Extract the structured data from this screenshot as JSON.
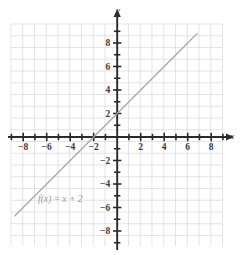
{
  "figure": {
    "title": "",
    "background_color": "#ffffff",
    "grid_color": "#d9d7e0",
    "axis_color": "#2b2b2b",
    "line_color": "#a8a8a8",
    "label_color": "#3b3b3b",
    "fn_label_color": "#9a9a9a"
  },
  "axes": {
    "x_axis_name": "x",
    "y_axis_name": "y",
    "x_tick_labels": [
      "-8",
      "-6",
      "-4",
      "-2",
      "2",
      "4",
      "6",
      "8"
    ],
    "y_tick_labels": [
      "8",
      "6",
      "4",
      "2",
      "-2",
      "-4",
      "-6",
      "-8"
    ],
    "x_tick_values": [
      -8,
      -6,
      -4,
      -2,
      2,
      4,
      6,
      8
    ],
    "y_tick_values": [
      8,
      6,
      4,
      2,
      -2,
      -4,
      -6,
      -8
    ],
    "minor_tick_values": [
      -9,
      -8,
      -7,
      -6,
      -5,
      -4,
      -3,
      -2,
      -1,
      1,
      2,
      3,
      4,
      5,
      6,
      7,
      8,
      9
    ]
  },
  "annotations": {
    "function_label": "f(x) = x + 2",
    "function_label_x": -6.6,
    "function_label_y": -5.2
  },
  "chart_data": {
    "type": "line",
    "title": "",
    "xlabel": "x",
    "ylabel": "y",
    "xlim": [
      -9,
      9
    ],
    "ylim": [
      -9.5,
      9.5
    ],
    "grid": true,
    "legend": "none",
    "series": [
      {
        "name": "f(x) = x + 2",
        "equation": "f(x) = x + 2",
        "slope": 1,
        "y_intercept": 2,
        "x_intercept": -2,
        "x": [
          -8.7,
          -8,
          -6,
          -4,
          -2,
          0,
          2,
          4,
          6,
          6.8
        ],
        "values": [
          -6.7,
          -6,
          -4,
          -2,
          0,
          2,
          4,
          6,
          8,
          8.8
        ]
      }
    ],
    "xticks": [
      -8,
      -6,
      -4,
      -2,
      2,
      4,
      6,
      8
    ],
    "yticks": [
      8,
      6,
      4,
      2,
      -2,
      -4,
      -6,
      -8
    ]
  }
}
